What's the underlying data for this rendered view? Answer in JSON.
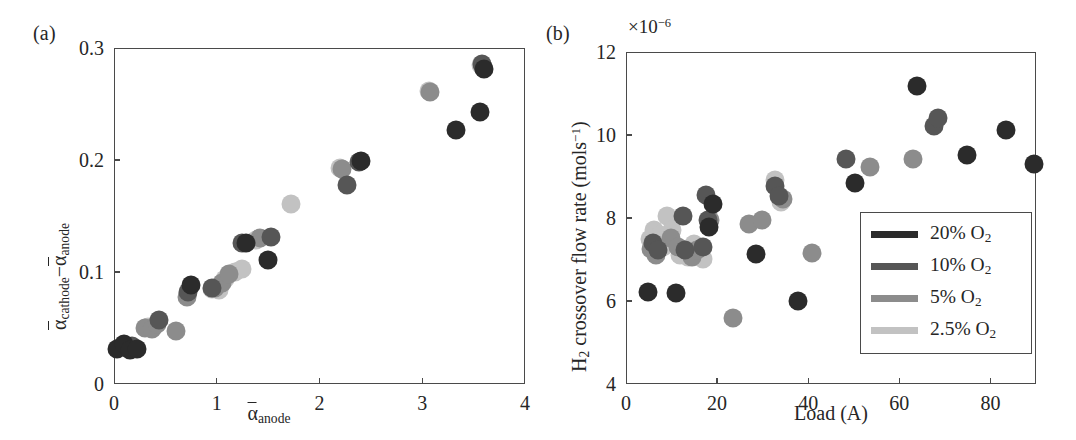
{
  "figure": {
    "panel_a_label": "(a)",
    "panel_b_label": "(b)"
  },
  "chart_data": [
    {
      "id": "panel-a",
      "type": "scatter",
      "title": "",
      "panel_label": "(a)",
      "xlabel": "ᾱ_anode",
      "xlabel_parts": {
        "base": "α",
        "sub": "anode"
      },
      "ylabel": "ᾱ_cathode − ᾱ_anode",
      "ylabel_parts": {
        "base1": "α",
        "sub1": "cathode",
        "minus": "−",
        "base2": "α",
        "sub2": "anode"
      },
      "xlim": [
        0,
        4
      ],
      "ylim": [
        0,
        0.3
      ],
      "xticks": [
        0,
        1,
        2,
        3,
        4
      ],
      "xticklabels": [
        "0",
        "1",
        "2",
        "3",
        "4"
      ],
      "yticks": [
        0,
        0.1,
        0.2,
        0.3
      ],
      "yticklabels": [
        "0",
        "0.1",
        "0.2",
        "0.3"
      ],
      "grid": false,
      "legend": null,
      "series": [
        {
          "name": "20% O2",
          "color": "#2b2b2b",
          "points": [
            [
              0.03,
              0.031
            ],
            [
              0.1,
              0.036
            ],
            [
              0.16,
              0.03
            ],
            [
              0.22,
              0.031
            ],
            [
              0.75,
              0.088
            ],
            [
              1.28,
              0.126
            ],
            [
              1.5,
              0.111
            ],
            [
              2.4,
              0.199
            ],
            [
              3.33,
              0.227
            ],
            [
              3.56,
              0.243
            ],
            [
              3.6,
              0.281
            ]
          ]
        },
        {
          "name": "10% O2",
          "color": "#565656",
          "points": [
            [
              0.07,
              0.033
            ],
            [
              0.18,
              0.034
            ],
            [
              0.44,
              0.057
            ],
            [
              0.72,
              0.082
            ],
            [
              0.95,
              0.086
            ],
            [
              1.25,
              0.126
            ],
            [
              1.53,
              0.131
            ],
            [
              2.27,
              0.178
            ],
            [
              2.38,
              0.198
            ],
            [
              3.58,
              0.286
            ]
          ]
        },
        {
          "name": "5% O2",
          "color": "#8c8c8c",
          "points": [
            [
              0.3,
              0.05
            ],
            [
              0.37,
              0.049
            ],
            [
              0.42,
              0.054
            ],
            [
              0.6,
              0.047
            ],
            [
              0.71,
              0.078
            ],
            [
              0.98,
              0.086
            ],
            [
              1.05,
              0.09
            ],
            [
              1.12,
              0.098
            ],
            [
              1.42,
              0.13
            ],
            [
              2.22,
              0.192
            ],
            [
              3.08,
              0.261
            ],
            [
              3.59,
              0.283
            ]
          ]
        },
        {
          "name": "2.5% O2",
          "color": "#c2c2c2",
          "points": [
            [
              0.33,
              0.051
            ],
            [
              0.95,
              0.085
            ],
            [
              1.02,
              0.084
            ],
            [
              1.08,
              0.094
            ],
            [
              1.18,
              0.1
            ],
            [
              1.25,
              0.103
            ],
            [
              1.38,
              0.129
            ],
            [
              1.72,
              0.161
            ],
            [
              2.2,
              0.193
            ],
            [
              3.07,
              0.262
            ],
            [
              3.57,
              0.285
            ]
          ]
        }
      ]
    },
    {
      "id": "panel-b",
      "type": "scatter",
      "title": "",
      "panel_label": "(b)",
      "xlabel": "Load (A)",
      "ylabel": "H₂ crossover flow rate (mols⁻¹)",
      "ylabel_parts": {
        "h": "H",
        "hsub": "2",
        "mid": " crossover flow rate (mols",
        "sup": "−1",
        "end": ")"
      },
      "axis_multiplier": "×10⁻⁶",
      "axis_multiplier_parts": {
        "base": "×10",
        "exp": "−6"
      },
      "xlim": [
        0,
        90
      ],
      "ylim": [
        4,
        12
      ],
      "xticks": [
        0,
        20,
        40,
        60,
        80
      ],
      "xticklabels": [
        "0",
        "20",
        "40",
        "60",
        "80"
      ],
      "yticks": [
        4,
        6,
        8,
        10,
        12
      ],
      "yticklabels": [
        "4",
        "6",
        "8",
        "10",
        "12"
      ],
      "grid": false,
      "legend": {
        "position": "lower-right",
        "entries": [
          {
            "label": "20% O2",
            "label_parts": {
              "pre": "20% O",
              "sub": "2"
            },
            "color": "#2b2b2b"
          },
          {
            "label": "10% O2",
            "label_parts": {
              "pre": "10% O",
              "sub": "2"
            },
            "color": "#565656"
          },
          {
            "label": "5% O2",
            "label_parts": {
              "pre": "5% O",
              "sub": "2"
            },
            "color": "#8c8c8c"
          },
          {
            "label": "2.5% O2",
            "label_parts": {
              "pre": "2.5% O",
              "sub": "2"
            },
            "color": "#c2c2c2"
          }
        ]
      },
      "series": [
        {
          "name": "20% O2",
          "color": "#2b2b2b",
          "points": [
            [
              4.8,
              6.22
            ],
            [
              11.0,
              6.2
            ],
            [
              18.3,
              7.78
            ],
            [
              19.2,
              8.33
            ],
            [
              28.5,
              7.14
            ],
            [
              37.8,
              6.01
            ],
            [
              50.2,
              8.84
            ],
            [
              63.8,
              11.18
            ],
            [
              74.8,
              9.53
            ],
            [
              83.5,
              10.13
            ],
            [
              89.5,
              9.31
            ]
          ]
        },
        {
          "name": "10% O2",
          "color": "#565656",
          "points": [
            [
              6.0,
              7.4
            ],
            [
              7.0,
              7.22
            ],
            [
              12.5,
              8.06
            ],
            [
              13.0,
              7.24
            ],
            [
              16.8,
              7.31
            ],
            [
              17.5,
              8.55
            ],
            [
              18.0,
              7.96
            ],
            [
              32.6,
              8.78
            ],
            [
              33.6,
              8.52
            ],
            [
              48.2,
              9.43
            ],
            [
              67.5,
              10.22
            ],
            [
              68.5,
              10.42
            ]
          ]
        },
        {
          "name": "5% O2",
          "color": "#8c8c8c",
          "points": [
            [
              5.5,
              7.26
            ],
            [
              6.5,
              7.1
            ],
            [
              9.8,
              7.52
            ],
            [
              11.5,
              7.3
            ],
            [
              14.5,
              7.06
            ],
            [
              15.5,
              7.22
            ],
            [
              18.5,
              7.95
            ],
            [
              23.4,
              5.58
            ],
            [
              27.0,
              7.86
            ],
            [
              29.8,
              7.96
            ],
            [
              34.4,
              8.46
            ],
            [
              40.8,
              7.15
            ],
            [
              53.5,
              9.24
            ],
            [
              63.0,
              9.41
            ]
          ]
        },
        {
          "name": "2.5% O2",
          "color": "#c2c2c2",
          "points": [
            [
              5.2,
              7.5
            ],
            [
              6.2,
              7.72
            ],
            [
              7.5,
              7.6
            ],
            [
              8.2,
              7.3
            ],
            [
              9.0,
              8.06
            ],
            [
              10.2,
              7.7
            ],
            [
              11.8,
              7.12
            ],
            [
              13.5,
              7.06
            ],
            [
              15.0,
              7.38
            ],
            [
              16.0,
              7.1
            ],
            [
              16.8,
              7.02
            ],
            [
              32.8,
              8.92
            ],
            [
              34.0,
              8.38
            ]
          ]
        }
      ]
    }
  ]
}
